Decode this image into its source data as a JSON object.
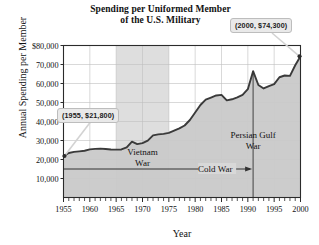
{
  "figure": {
    "title_line1": "Spending per Uniformed Member",
    "title_line2": "of the U.S. Military"
  },
  "callouts": {
    "start": "(1955, $21,800)",
    "end": "(2000, $74,300)"
  },
  "annotations": {
    "vietnam_line1": "Vietnam",
    "vietnam_line2": "War",
    "cold_war": "Cold War",
    "gulf_line1": "Persian Gulf",
    "gulf_line2": "War"
  },
  "colors": {
    "line": "#3a3a3a",
    "fill": "#c9c9c9",
    "band": "#dedede",
    "grid": "#bfbfbf",
    "axis": "#2b2b2b",
    "callout_bg": "#e9e9e9",
    "callout_border": "#bdbdbd"
  },
  "chart_data": {
    "type": "area",
    "title": "Spending per Uniformed Member of the U.S. Military",
    "xlabel": "Year",
    "ylabel": "Annual Spending per Member",
    "xlim": [
      1955,
      2000
    ],
    "ylim": [
      0,
      80000
    ],
    "grid": true,
    "legend": "none",
    "xticks": [
      1955,
      1960,
      1965,
      1970,
      1975,
      1980,
      1985,
      1990,
      1995,
      2000
    ],
    "xtick_labels": [
      "1955",
      "1960",
      "1965",
      "1970",
      "1975",
      "1980",
      "1985",
      "1990",
      "1995",
      "2000"
    ],
    "xminor_tick_interval": 1,
    "yticks": [
      10000,
      20000,
      30000,
      40000,
      50000,
      60000,
      70000,
      80000
    ],
    "ytick_labels": [
      "10,000",
      "20,000",
      "30,000",
      "40,000",
      "50,000",
      "60,000",
      "70,000",
      "$80,000"
    ],
    "x": [
      1955,
      1956,
      1957,
      1958,
      1959,
      1960,
      1961,
      1962,
      1963,
      1964,
      1965,
      1966,
      1967,
      1968,
      1969,
      1970,
      1971,
      1972,
      1973,
      1974,
      1975,
      1976,
      1977,
      1978,
      1979,
      1980,
      1981,
      1982,
      1983,
      1984,
      1985,
      1986,
      1987,
      1988,
      1989,
      1990,
      1991,
      1992,
      1993,
      1994,
      1995,
      1996,
      1997,
      1998,
      1999,
      2000
    ],
    "values": [
      21800,
      23400,
      24000,
      24300,
      24600,
      25300,
      25600,
      25700,
      25500,
      25300,
      25200,
      25300,
      26400,
      29400,
      28100,
      28600,
      29900,
      32700,
      33200,
      33500,
      34000,
      35200,
      36400,
      37900,
      40800,
      44700,
      48700,
      51500,
      52600,
      53700,
      54000,
      51100,
      51700,
      52700,
      54000,
      57000,
      66500,
      59200,
      57400,
      58600,
      59700,
      63300,
      64200,
      64000,
      69600,
      74300
    ],
    "series_note": "Annual spending per uniformed member in U.S. dollars",
    "shaded_bands": [
      {
        "label": "Vietnam War",
        "x0": 1965,
        "x1": 1975
      },
      {
        "label": "Cold War",
        "x0": 1955,
        "x1": 1991,
        "style": "arrow-line",
        "y": 15000
      }
    ],
    "event_markers": [
      {
        "label": "Persian Gulf War",
        "x": 1991,
        "y_top": 66500
      }
    ],
    "annotated_points": [
      {
        "x": 1955,
        "y": 21800,
        "label": "(1955, $21,800)"
      },
      {
        "x": 2000,
        "y": 74300,
        "label": "(2000, $74,300)"
      }
    ]
  }
}
